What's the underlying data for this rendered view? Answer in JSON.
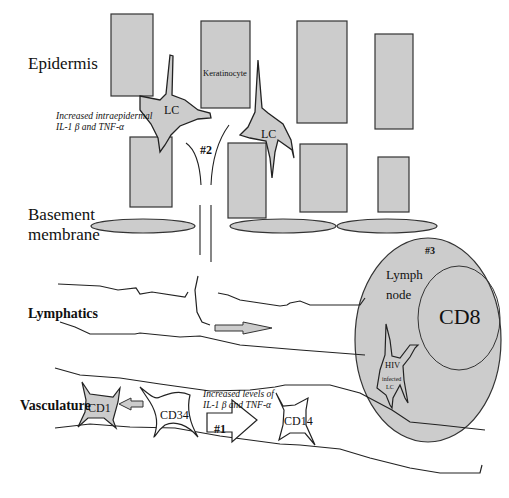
{
  "figure": {
    "regions": {
      "epidermis": "Epidermis",
      "basement_line1": "Basement",
      "basement_line2": "membrane",
      "lymphatics": "Lymphatics",
      "vasculature": "Vasculature"
    },
    "cells": {
      "keratinocyte": "Keratinocyte",
      "lc1": "LC",
      "lc2": "LC",
      "cd1": "CD1",
      "cd34": "CD34",
      "cd14": "CD14",
      "cd8": "CD8",
      "hiv_line1": "HIV",
      "hiv_line2": "infected",
      "hiv_line3": "LC"
    },
    "annotations": {
      "epi_line1": "Increased intraepidermal",
      "epi_line2": "IL-1 β and TNF-α",
      "vasc_line1": "Increased levels of",
      "vasc_line2": "IL-1 β and TNF-α",
      "step1": "#1",
      "step2": "#2",
      "step3": "#3",
      "lymph_line1": "Lymph",
      "lymph_line2": "node"
    },
    "colors": {
      "fill": "#cccccc",
      "stroke": "#333333"
    }
  }
}
